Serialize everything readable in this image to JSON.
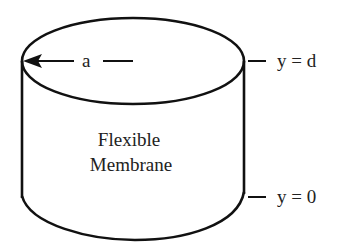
{
  "diagram": {
    "radius_label": "a",
    "top_label": "y = d",
    "bottom_label": "y = 0",
    "body_label_line1": "Flexible",
    "body_label_line2": "Membrane"
  },
  "colors": {
    "stroke": "#111111",
    "text": "#222222",
    "background": "#ffffff"
  }
}
